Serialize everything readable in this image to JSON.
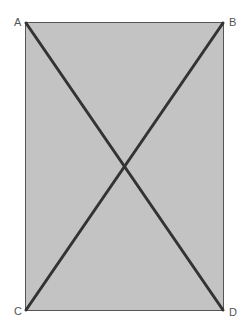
{
  "diagram": {
    "shape": "rectangle",
    "fill_color": "#c3c3c3",
    "border_color": "#555555",
    "diagonal_color": "#333333",
    "vertices": [
      {
        "label": "A",
        "x": 25,
        "y": 22
      },
      {
        "label": "B",
        "x": 223,
        "y": 22
      },
      {
        "label": "C",
        "x": 25,
        "y": 310
      },
      {
        "label": "D",
        "x": 223,
        "y": 310
      }
    ],
    "diagonals": [
      "AD",
      "BC"
    ]
  }
}
